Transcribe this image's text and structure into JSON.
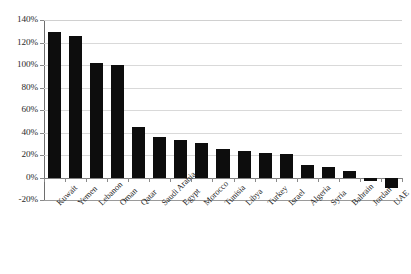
{
  "chart_data": {
    "type": "bar",
    "title": "",
    "subtitle": "",
    "xlabel": "",
    "ylabel": "",
    "ylim": [
      -20,
      140
    ],
    "ytick_values": [
      140,
      120,
      100,
      80,
      60,
      40,
      20,
      0,
      -20
    ],
    "ytick_labels": [
      "140%",
      "120%",
      "100%",
      "80%",
      "60%",
      "40%",
      "20%",
      "0%",
      "-20%"
    ],
    "grid": true,
    "legend": false,
    "legend_position": "none",
    "bar_color": "#0d0d0d",
    "gridline_color": "#d9d9d9",
    "axis_color": "#6e6e6e",
    "categories": [
      "Kuwait",
      "Yemen",
      "Lebanon",
      "Oman",
      "Qatar",
      "Saudi Arabia",
      "Egypt",
      "Morocco",
      "Tunisia",
      "Libya",
      "Turkey",
      "Israel",
      "Algeria",
      "Syria",
      "Bahrain",
      "Jordan",
      "UAE"
    ],
    "values": [
      129,
      126,
      102,
      100,
      45,
      36,
      33,
      31,
      25,
      24,
      22,
      21,
      11,
      9,
      6,
      -3,
      -9
    ],
    "value_labels": [
      "129%",
      "126%",
      "102%",
      "100%",
      "45%",
      "36%",
      "33%",
      "31%",
      "25%",
      "24%",
      "22%",
      "21%",
      "11%",
      "9%",
      "6%",
      "-3%",
      "-9%"
    ]
  }
}
